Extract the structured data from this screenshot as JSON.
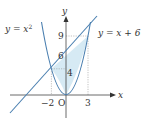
{
  "figure": {
    "curve_label": "y = x",
    "curve_label_exp": "2",
    "line_label": "y = x + 6",
    "x_axis_label": "x",
    "y_axis_label": "y",
    "origin_label": "O",
    "x_ticks": [
      "−2",
      "3"
    ],
    "y_ticks": [
      "9",
      "6",
      "4"
    ],
    "colors": {
      "curve": "#4a7fb0",
      "line": "#4a7fb0",
      "shade": "#d6eaf4",
      "axes": "#444444",
      "dashed": "#888888"
    }
  }
}
